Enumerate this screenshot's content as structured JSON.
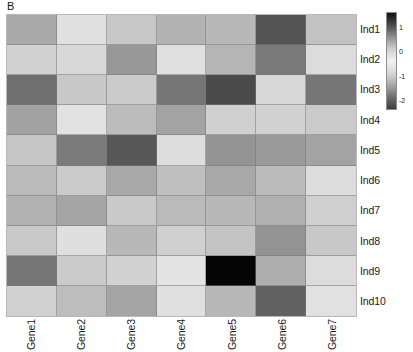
{
  "panel": {
    "label": "B"
  },
  "chart_data": {
    "type": "heatmap",
    "title": "",
    "xlabel": "",
    "ylabel": "",
    "grid": true,
    "legend_position": "right",
    "categories_x": [
      "Gene1",
      "Gene2",
      "Gene3",
      "Gene4",
      "Gene5",
      "Gene6",
      "Gene7"
    ],
    "categories_y": [
      "Ind1",
      "Ind2",
      "Ind3",
      "Ind4",
      "Ind5",
      "Ind6",
      "Ind7",
      "Ind8",
      "Ind9",
      "Ind10"
    ],
    "colorbar": {
      "ticks": [
        "1",
        "0",
        "-1",
        "-2"
      ],
      "tick_values": [
        1,
        0,
        -1,
        -2
      ],
      "vmin": -2.4,
      "vmax": 1.6,
      "colormap": "grayscale-diverging-dark-light-dark",
      "stops": [
        "#111111",
        "#4a4a4a",
        "#8f8f8f",
        "#cfcfcf",
        "#f2f2f2",
        "#d8d8d8",
        "#a8a8a8",
        "#6e6e6e",
        "#3c3c3c"
      ]
    },
    "values": [
      [
        -0.45,
        0.35,
        0.05,
        -0.35,
        -0.25,
        1.25,
        -0.1
      ],
      [
        0.15,
        0.25,
        -0.8,
        0.35,
        -0.3,
        -1.05,
        0.3
      ],
      [
        -1.15,
        0.05,
        0.1,
        -1.0,
        -1.45,
        0.3,
        -1.0
      ],
      [
        -0.55,
        0.45,
        -0.2,
        -0.55,
        0.15,
        0.15,
        0.1
      ],
      [
        0.0,
        -1.05,
        -1.35,
        0.35,
        -0.75,
        -0.7,
        -0.55
      ],
      [
        -0.2,
        0.05,
        -0.45,
        -0.15,
        -0.45,
        -0.2,
        0.35
      ],
      [
        -0.35,
        -0.5,
        0.1,
        -0.2,
        -0.25,
        -0.3,
        0.15
      ],
      [
        0.05,
        0.4,
        -0.25,
        0.15,
        0.0,
        -0.85,
        0.05
      ],
      [
        -1.05,
        0.1,
        0.2,
        0.45,
        1.6,
        -0.35,
        0.3
      ],
      [
        0.2,
        -0.15,
        -0.5,
        0.4,
        -0.25,
        -1.3,
        0.4
      ]
    ],
    "cell_colors": [
      [
        "#a9a9a9",
        "#e0e0e0",
        "#c7c7c7",
        "#b3b3b3",
        "#b8b8b8",
        "#545454",
        "#c2c2c2"
      ],
      [
        "#d2d2d2",
        "#d8d8d8",
        "#989898",
        "#e0e0e0",
        "#b5b5b5",
        "#797979",
        "#dcdcdc"
      ],
      [
        "#6f6f6f",
        "#c8c8c8",
        "#cacaca",
        "#767676",
        "#4b4b4b",
        "#d8d8d8",
        "#767676"
      ],
      [
        "#a2a2a2",
        "#e2e2e2",
        "#bcbcbc",
        "#a3a3a3",
        "#d0d0d0",
        "#d2d2d2",
        "#cacaca"
      ],
      [
        "#c6c6c6",
        "#7b7b7b",
        "#585858",
        "#dddddd",
        "#949494",
        "#9a9a9a",
        "#a3a3a3"
      ],
      [
        "#bababa",
        "#cacaca",
        "#a8a8a8",
        "#bfbfbf",
        "#a8a8a8",
        "#bababa",
        "#dcdcdc"
      ],
      [
        "#b2b2b2",
        "#a5a5a5",
        "#c9c9c9",
        "#bababa",
        "#b8b8b8",
        "#b0b0b0",
        "#cfcfcf"
      ],
      [
        "#c9c9c9",
        "#dfdfdf",
        "#b8b8b8",
        "#d0d0d0",
        "#c4c4c4",
        "#939393",
        "#c8c8c8"
      ],
      [
        "#767676",
        "#cbcbcb",
        "#d2d2d2",
        "#e3e3e3",
        "#050505",
        "#aeaeae",
        "#dcdcdc"
      ],
      [
        "#d1d1d1",
        "#bdbdbd",
        "#a5a5a5",
        "#e0e0e0",
        "#b8b8b8",
        "#616161",
        "#e1e1e1"
      ]
    ]
  }
}
